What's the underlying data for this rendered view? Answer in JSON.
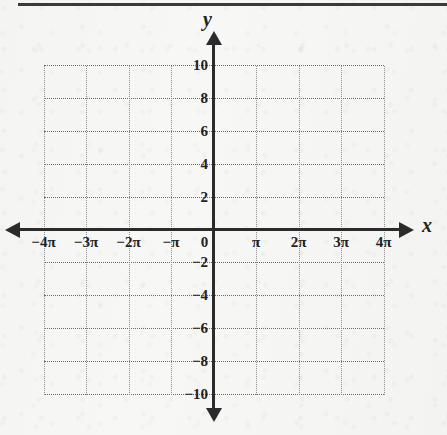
{
  "page": {
    "background_color": "#f7f7f5",
    "rule_color": "#3a3a3a",
    "axis_color": "#2b2b2b",
    "grid_color": "#8e8e8e"
  },
  "axis_names": {
    "x": "x",
    "y": "y"
  },
  "origin_label": "0",
  "x_ticks": [
    {
      "label": "−4π",
      "value": -4
    },
    {
      "label": "−3π",
      "value": -3
    },
    {
      "label": "−2π",
      "value": -2
    },
    {
      "label": "−π",
      "value": -1
    },
    {
      "label": "0",
      "value": 0
    },
    {
      "label": "π",
      "value": 1
    },
    {
      "label": "2π",
      "value": 2
    },
    {
      "label": "3π",
      "value": 3
    },
    {
      "label": "4π",
      "value": 4
    }
  ],
  "y_ticks": [
    {
      "label": "10",
      "value": 10
    },
    {
      "label": "8",
      "value": 8
    },
    {
      "label": "6",
      "value": 6
    },
    {
      "label": "4",
      "value": 4
    },
    {
      "label": "2",
      "value": 2
    },
    {
      "label": "−2",
      "value": -2
    },
    {
      "label": "−4",
      "value": -4
    },
    {
      "label": "−6",
      "value": -6
    },
    {
      "label": "−8",
      "value": -8
    },
    {
      "label": "−10",
      "value": -10
    }
  ],
  "chart_data": {
    "type": "line",
    "title": "",
    "subtitle": "",
    "xlabel": "x",
    "ylabel": "y",
    "xlim": [
      -4,
      4
    ],
    "ylim": [
      -10,
      10
    ],
    "x_unit": "pi",
    "x_tick_labels": [
      "−4π",
      "−3π",
      "−2π",
      "−π",
      "0",
      "π",
      "2π",
      "3π",
      "4π"
    ],
    "x_tick_values": [
      -4,
      -3,
      -2,
      -1,
      0,
      1,
      2,
      3,
      4
    ],
    "y_tick_labels": [
      "−10",
      "−8",
      "−6",
      "−4",
      "−2",
      "2",
      "4",
      "6",
      "8",
      "10"
    ],
    "y_tick_values": [
      -10,
      -8,
      -6,
      -4,
      -2,
      2,
      4,
      6,
      8,
      10
    ],
    "x_major_step": 1,
    "y_major_step": 2,
    "grid": true,
    "grid_style": "dotted",
    "legend": null,
    "series": [],
    "annotations": [],
    "note": "Empty coordinate grid for graphing trigonometric functions; no data plotted."
  }
}
